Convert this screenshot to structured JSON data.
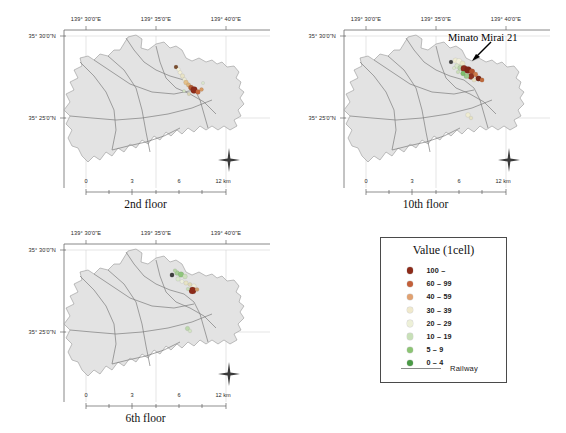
{
  "figure": {
    "background": "#ffffff",
    "land_color": "#e3e3e3",
    "land_outline_color": "#8d8d8d",
    "railway_color": "#7c7c7c",
    "axis_color": "#6b6b6b",
    "grid_color": "#c8c8c8"
  },
  "axes": {
    "lon_ticks": [
      "139° 30'0\"E",
      "139° 35'0\"E",
      "139° 40'0\"E"
    ],
    "lat_ticks": [
      "35° 30'0\"N",
      "35° 25'0\"N"
    ],
    "scale_ticks": [
      "0",
      "3",
      "6",
      "12 km"
    ],
    "compass_icon": "compass-rose-icon"
  },
  "panels": [
    {
      "id": "panel-2nd-floor",
      "title": "2nd floor",
      "annotation": null,
      "points": [
        {
          "x": 168.0,
          "y": 61.0,
          "r": 2.0,
          "color": "#7b4e2e"
        },
        {
          "x": 170.5,
          "y": 63.5,
          "r": 1.8,
          "color": "#f6f3dc"
        },
        {
          "x": 172.0,
          "y": 66.5,
          "r": 2.0,
          "color": "#f3efd6"
        },
        {
          "x": 174.5,
          "y": 70.0,
          "r": 2.2,
          "color": "#e8e3c6"
        },
        {
          "x": 176.5,
          "y": 73.5,
          "r": 2.0,
          "color": "#ecead3"
        },
        {
          "x": 178.0,
          "y": 76.5,
          "r": 2.4,
          "color": "#e3c08a"
        },
        {
          "x": 180.5,
          "y": 79.0,
          "r": 2.2,
          "color": "#ddb27a"
        },
        {
          "x": 183.0,
          "y": 81.5,
          "r": 2.6,
          "color": "#b45c34"
        },
        {
          "x": 186.0,
          "y": 84.0,
          "r": 3.4,
          "color": "#8c2b1a"
        },
        {
          "x": 190.0,
          "y": 86.0,
          "r": 2.4,
          "color": "#c6653a"
        },
        {
          "x": 193.5,
          "y": 83.5,
          "r": 2.0,
          "color": "#d79a64"
        },
        {
          "x": 181.0,
          "y": 88.0,
          "r": 1.8,
          "color": "#d8d2b2"
        },
        {
          "x": 176.0,
          "y": 85.0,
          "r": 1.6,
          "color": "#cfe0bf"
        },
        {
          "x": 195.0,
          "y": 77.0,
          "r": 1.6,
          "color": "#dbe7cd"
        }
      ]
    },
    {
      "id": "panel-10th-floor",
      "title": "10th floor",
      "annotation": {
        "text": "Minato Mirai 21",
        "arrow_icon": "arrow-down-left-icon"
      },
      "points": [
        {
          "x": 163.0,
          "y": 56.0,
          "r": 2.0,
          "color": "#3f3f3f"
        },
        {
          "x": 167.5,
          "y": 54.5,
          "r": 2.6,
          "color": "#efecd2"
        },
        {
          "x": 171.0,
          "y": 55.5,
          "r": 3.0,
          "color": "#f2f0dd"
        },
        {
          "x": 174.5,
          "y": 57.5,
          "r": 2.6,
          "color": "#eae6c8"
        },
        {
          "x": 169.0,
          "y": 60.0,
          "r": 2.4,
          "color": "#d9e6cb"
        },
        {
          "x": 172.5,
          "y": 62.0,
          "r": 2.8,
          "color": "#b9d3a8"
        },
        {
          "x": 176.0,
          "y": 62.5,
          "r": 3.2,
          "color": "#8c2b1a"
        },
        {
          "x": 180.0,
          "y": 64.0,
          "r": 3.6,
          "color": "#7e2415"
        },
        {
          "x": 184.0,
          "y": 65.5,
          "r": 2.8,
          "color": "#b0502c"
        },
        {
          "x": 187.5,
          "y": 68.5,
          "r": 2.4,
          "color": "#cd7a48"
        },
        {
          "x": 183.0,
          "y": 70.5,
          "r": 3.0,
          "color": "#8f3320"
        },
        {
          "x": 178.5,
          "y": 70.0,
          "r": 2.6,
          "color": "#9ec98c"
        },
        {
          "x": 175.0,
          "y": 67.5,
          "r": 2.4,
          "color": "#7fbd6d"
        },
        {
          "x": 190.5,
          "y": 72.5,
          "r": 2.8,
          "color": "#7a2716"
        },
        {
          "x": 194.0,
          "y": 74.0,
          "r": 2.2,
          "color": "#c06a3c"
        },
        {
          "x": 186.0,
          "y": 74.0,
          "r": 2.0,
          "color": "#e6dfbe"
        },
        {
          "x": 170.0,
          "y": 66.0,
          "r": 1.8,
          "color": "#c9dcb8"
        },
        {
          "x": 166.0,
          "y": 62.0,
          "r": 1.6,
          "color": "#dce8ce"
        },
        {
          "x": 180.0,
          "y": 109.0,
          "r": 2.4,
          "color": "#efecd2"
        },
        {
          "x": 183.0,
          "y": 112.0,
          "r": 1.8,
          "color": "#e6e2c2"
        }
      ]
    },
    {
      "id": "panel-6th-floor",
      "title": "6th floor",
      "annotation": null,
      "points": [
        {
          "x": 164.0,
          "y": 55.0,
          "r": 2.2,
          "color": "#3f3f3f"
        },
        {
          "x": 169.0,
          "y": 53.0,
          "r": 2.4,
          "color": "#a9cf97"
        },
        {
          "x": 173.0,
          "y": 54.5,
          "r": 2.8,
          "color": "#8fc57c"
        },
        {
          "x": 177.0,
          "y": 56.5,
          "r": 2.4,
          "color": "#cde0bd"
        },
        {
          "x": 170.0,
          "y": 59.0,
          "r": 2.2,
          "color": "#dbe9cd"
        },
        {
          "x": 174.0,
          "y": 61.5,
          "r": 2.0,
          "color": "#eef0de"
        },
        {
          "x": 178.0,
          "y": 63.0,
          "r": 2.2,
          "color": "#e7e3c4"
        },
        {
          "x": 182.0,
          "y": 64.5,
          "r": 2.0,
          "color": "#dfd9b6"
        },
        {
          "x": 186.0,
          "y": 66.0,
          "r": 2.2,
          "color": "#f0eddb"
        },
        {
          "x": 184.5,
          "y": 70.5,
          "r": 3.6,
          "color": "#8c2b1a"
        },
        {
          "x": 189.0,
          "y": 69.5,
          "r": 2.0,
          "color": "#cfa06e"
        },
        {
          "x": 180.0,
          "y": 69.0,
          "r": 1.8,
          "color": "#c7dcb6"
        },
        {
          "x": 167.0,
          "y": 50.5,
          "r": 1.8,
          "color": "#b6d5a4"
        },
        {
          "x": 179.5,
          "y": 108.5,
          "r": 2.2,
          "color": "#bcd8ab"
        },
        {
          "x": 182.0,
          "y": 111.0,
          "r": 1.8,
          "color": "#d3e4c3"
        }
      ]
    }
  ],
  "legend": {
    "title": "Value (1cell)",
    "entries": [
      {
        "label": "100 –",
        "color": "#8c2b1a"
      },
      {
        "label": "60 – 99",
        "color": "#c3603a"
      },
      {
        "label": "40 – 59",
        "color": "#e1a171"
      },
      {
        "label": "30 – 39",
        "color": "#f0e9cc"
      },
      {
        "label": "20 – 29",
        "color": "#edf0d8"
      },
      {
        "label": "10 – 19",
        "color": "#c8e0b8"
      },
      {
        "label": "5 – 9",
        "color": "#8cc474"
      },
      {
        "label": "0 – 4",
        "color": "#4a9a46"
      }
    ],
    "railway_label": "Railway",
    "railway_color": "#8a8a8a"
  }
}
